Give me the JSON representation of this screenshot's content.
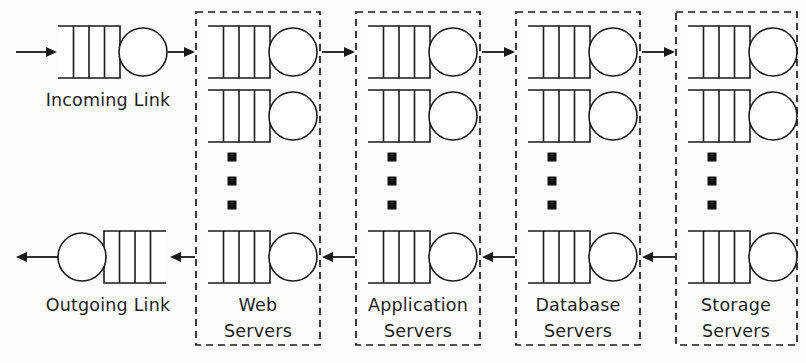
{
  "diagram": {
    "type": "queueing-network",
    "width": 806,
    "height": 363,
    "background_color": "#fdfdfc",
    "line_color": "#1a1a1a",
    "text_color": "#1d1d1d"
  },
  "links": [
    {
      "id": "incoming-link",
      "label": "Incoming Link",
      "orientation": "queue-then-server",
      "direction": "left-to-right",
      "row": "top",
      "label_x": 108,
      "label_y": 106,
      "queue": {
        "x": 58,
        "y": 26,
        "width": 62,
        "height": 52,
        "slots": 4,
        "open_side": "left"
      },
      "server": {
        "cx": 143,
        "cy": 52,
        "r": 24
      }
    },
    {
      "id": "outgoing-link",
      "label": "Outgoing Link",
      "orientation": "server-then-queue",
      "direction": "right-to-left",
      "row": "bottom",
      "label_x": 108,
      "label_y": 311,
      "queue": {
        "x": 104,
        "y": 231,
        "width": 62,
        "height": 52,
        "slots": 4,
        "open_side": "right"
      },
      "server": {
        "cx": 82,
        "cy": 257,
        "r": 24
      }
    }
  ],
  "groups": [
    {
      "id": "web-servers",
      "label_line1": "Web",
      "label_line2": "Servers",
      "box": {
        "x": 196,
        "y": 12,
        "width": 124,
        "height": 333
      },
      "label_x": 258,
      "label_line1_y": 311,
      "label_line2_y": 337,
      "stations": [
        {
          "row": 1,
          "queue": {
            "x": 208,
            "y": 26,
            "width": 62,
            "height": 52,
            "slots": 4
          },
          "server": {
            "cx": 293,
            "cy": 52,
            "r": 24
          }
        },
        {
          "row": 2,
          "queue": {
            "x": 208,
            "y": 90,
            "width": 62,
            "height": 52,
            "slots": 4
          },
          "server": {
            "cx": 293,
            "cy": 116,
            "r": 24
          }
        },
        {
          "row": "last",
          "queue": {
            "x": 208,
            "y": 231,
            "width": 62,
            "height": 52,
            "slots": 4
          },
          "server": {
            "cx": 293,
            "cy": 257,
            "r": 24
          }
        }
      ],
      "ellipsis": {
        "x": 232,
        "ys": [
          157,
          181,
          205
        ],
        "size": 9
      }
    },
    {
      "id": "application-servers",
      "label_line1": "Application",
      "label_line2": "Servers",
      "box": {
        "x": 356,
        "y": 12,
        "width": 124,
        "height": 333
      },
      "label_x": 418,
      "label_line1_y": 311,
      "label_line2_y": 337,
      "stations": [
        {
          "row": 1,
          "queue": {
            "x": 368,
            "y": 26,
            "width": 62,
            "height": 52,
            "slots": 4
          },
          "server": {
            "cx": 453,
            "cy": 52,
            "r": 24
          }
        },
        {
          "row": 2,
          "queue": {
            "x": 368,
            "y": 90,
            "width": 62,
            "height": 52,
            "slots": 4
          },
          "server": {
            "cx": 453,
            "cy": 116,
            "r": 24
          }
        },
        {
          "row": "last",
          "queue": {
            "x": 368,
            "y": 231,
            "width": 62,
            "height": 52,
            "slots": 4
          },
          "server": {
            "cx": 453,
            "cy": 257,
            "r": 24
          }
        }
      ],
      "ellipsis": {
        "x": 392,
        "ys": [
          157,
          181,
          205
        ],
        "size": 9
      }
    },
    {
      "id": "database-servers",
      "label_line1": "Database",
      "label_line2": "Servers",
      "box": {
        "x": 516,
        "y": 12,
        "width": 124,
        "height": 333
      },
      "label_x": 578,
      "label_line1_y": 311,
      "label_line2_y": 337,
      "stations": [
        {
          "row": 1,
          "queue": {
            "x": 528,
            "y": 26,
            "width": 62,
            "height": 52,
            "slots": 4
          },
          "server": {
            "cx": 613,
            "cy": 52,
            "r": 24
          }
        },
        {
          "row": 2,
          "queue": {
            "x": 528,
            "y": 90,
            "width": 62,
            "height": 52,
            "slots": 4
          },
          "server": {
            "cx": 613,
            "cy": 116,
            "r": 24
          }
        },
        {
          "row": "last",
          "queue": {
            "x": 528,
            "y": 231,
            "width": 62,
            "height": 52,
            "slots": 4
          },
          "server": {
            "cx": 613,
            "cy": 257,
            "r": 24
          }
        }
      ],
      "ellipsis": {
        "x": 552,
        "ys": [
          157,
          181,
          205
        ],
        "size": 9
      }
    },
    {
      "id": "storage-servers",
      "label_line1": "Storage",
      "label_line2": "Servers",
      "box": {
        "x": 676,
        "y": 12,
        "width": 121,
        "height": 333
      },
      "label_x": 736,
      "label_line1_y": 311,
      "label_line2_y": 337,
      "stations": [
        {
          "row": 1,
          "queue": {
            "x": 688,
            "y": 26,
            "width": 62,
            "height": 52,
            "slots": 4
          },
          "server": {
            "cx": 773,
            "cy": 52,
            "r": 24
          }
        },
        {
          "row": 2,
          "queue": {
            "x": 688,
            "y": 90,
            "width": 62,
            "height": 52,
            "slots": 4
          },
          "server": {
            "cx": 773,
            "cy": 116,
            "r": 24
          }
        },
        {
          "row": "last",
          "queue": {
            "x": 688,
            "y": 231,
            "width": 62,
            "height": 52,
            "slots": 4
          },
          "server": {
            "cx": 773,
            "cy": 257,
            "r": 24
          }
        }
      ],
      "ellipsis": {
        "x": 712,
        "ys": [
          157,
          181,
          205
        ],
        "size": 9
      }
    }
  ],
  "arrows": [
    {
      "id": "arrow-external-to-incoming",
      "x1": 16,
      "y1": 52,
      "x2": 57,
      "y2": 52,
      "direction": "right"
    },
    {
      "id": "arrow-incoming-to-web",
      "x1": 168,
      "y1": 52,
      "x2": 195,
      "y2": 52,
      "direction": "right"
    },
    {
      "id": "arrow-web-to-application",
      "x1": 322,
      "y1": 52,
      "x2": 355,
      "y2": 52,
      "direction": "right"
    },
    {
      "id": "arrow-application-to-database",
      "x1": 482,
      "y1": 52,
      "x2": 515,
      "y2": 52,
      "direction": "right"
    },
    {
      "id": "arrow-database-to-storage",
      "x1": 642,
      "y1": 52,
      "x2": 675,
      "y2": 52,
      "direction": "right"
    },
    {
      "id": "arrow-storage-to-database",
      "x1": 675,
      "y1": 257,
      "x2": 642,
      "y2": 257,
      "direction": "left"
    },
    {
      "id": "arrow-database-to-application",
      "x1": 515,
      "y1": 257,
      "x2": 482,
      "y2": 257,
      "direction": "left"
    },
    {
      "id": "arrow-application-to-web",
      "x1": 355,
      "y1": 257,
      "x2": 322,
      "y2": 257,
      "direction": "left"
    },
    {
      "id": "arrow-web-to-outgoing",
      "x1": 195,
      "y1": 257,
      "x2": 170,
      "y2": 257,
      "direction": "left"
    },
    {
      "id": "arrow-outgoing-to-external",
      "x1": 58,
      "y1": 257,
      "x2": 16,
      "y2": 257,
      "direction": "left"
    }
  ]
}
